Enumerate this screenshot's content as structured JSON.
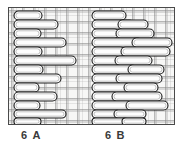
{
  "figure": {
    "kind": "embroidery-stitch-diagram",
    "background": "woven-fabric-grid",
    "panel": {
      "fill_color": "#f7f7f6",
      "thread_color": "#848484",
      "border_color": "#4a4a4a"
    },
    "stitch_style": {
      "fill_color": "#fdfdfd",
      "outline_color": "#1b1b1b",
      "shape": "capsule"
    }
  },
  "captions": [
    {
      "id": "a",
      "label": "6 А"
    },
    {
      "id": "b",
      "label": "6 В"
    }
  ],
  "diagrams": [
    {
      "id": "a",
      "caption": "6 А",
      "description": "Single vertical column of alternating short and long horizontal capsule stitches forming a zigzag ladder.",
      "stitch_count": 15
    },
    {
      "id": "b",
      "caption": "6 В",
      "description": "Two offset vertical columns of horizontal capsule stitches staggered in a brick-like arrangement.",
      "stitch_count": 26
    }
  ],
  "stitches_a": [
    {
      "x": 6,
      "y": 4,
      "w": 28,
      "h": 9
    },
    {
      "x": 6,
      "y": 13,
      "w": 44,
      "h": 9
    },
    {
      "x": 6,
      "y": 22,
      "w": 27,
      "h": 9
    },
    {
      "x": 6,
      "y": 31,
      "w": 52,
      "h": 9
    },
    {
      "x": 6,
      "y": 40,
      "w": 28,
      "h": 9
    },
    {
      "x": 6,
      "y": 49,
      "w": 62,
      "h": 9
    },
    {
      "x": 6,
      "y": 58,
      "w": 29,
      "h": 9
    },
    {
      "x": 6,
      "y": 67,
      "w": 47,
      "h": 9
    },
    {
      "x": 6,
      "y": 76,
      "w": 25,
      "h": 9
    },
    {
      "x": 6,
      "y": 85,
      "w": 43,
      "h": 9
    },
    {
      "x": 6,
      "y": 94,
      "w": 26,
      "h": 9
    },
    {
      "x": 6,
      "y": 103,
      "w": 52,
      "h": 8
    },
    {
      "x": 6,
      "y": 111,
      "w": 27,
      "h": 7
    }
  ],
  "stitches_b": [
    {
      "x": 84,
      "y": 4,
      "w": 34,
      "h": 9
    },
    {
      "x": 84,
      "y": 13,
      "w": 42,
      "h": 9
    },
    {
      "x": 110,
      "y": 13,
      "w": 30,
      "h": 9
    },
    {
      "x": 84,
      "y": 22,
      "w": 27,
      "h": 9
    },
    {
      "x": 108,
      "y": 22,
      "w": 38,
      "h": 9
    },
    {
      "x": 84,
      "y": 31,
      "w": 50,
      "h": 9
    },
    {
      "x": 124,
      "y": 31,
      "w": 40,
      "h": 9
    },
    {
      "x": 84,
      "y": 40,
      "w": 33,
      "h": 9
    },
    {
      "x": 113,
      "y": 40,
      "w": 49,
      "h": 9
    },
    {
      "x": 84,
      "y": 49,
      "w": 28,
      "h": 9
    },
    {
      "x": 107,
      "y": 49,
      "w": 37,
      "h": 9
    },
    {
      "x": 84,
      "y": 58,
      "w": 44,
      "h": 9
    },
    {
      "x": 120,
      "y": 58,
      "w": 36,
      "h": 9
    },
    {
      "x": 84,
      "y": 67,
      "w": 30,
      "h": 9
    },
    {
      "x": 108,
      "y": 67,
      "w": 46,
      "h": 9
    },
    {
      "x": 84,
      "y": 76,
      "w": 38,
      "h": 9
    },
    {
      "x": 116,
      "y": 76,
      "w": 34,
      "h": 9
    },
    {
      "x": 84,
      "y": 85,
      "w": 26,
      "h": 9
    },
    {
      "x": 104,
      "y": 85,
      "w": 50,
      "h": 9
    },
    {
      "x": 84,
      "y": 94,
      "w": 40,
      "h": 9
    },
    {
      "x": 118,
      "y": 94,
      "w": 42,
      "h": 9
    },
    {
      "x": 84,
      "y": 103,
      "w": 28,
      "h": 8
    },
    {
      "x": 106,
      "y": 103,
      "w": 32,
      "h": 8
    },
    {
      "x": 84,
      "y": 111,
      "w": 36,
      "h": 7
    },
    {
      "x": 114,
      "y": 111,
      "w": 24,
      "h": 7
    }
  ]
}
